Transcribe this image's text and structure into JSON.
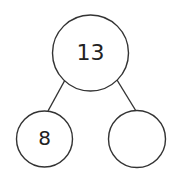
{
  "diagram": {
    "type": "number-bond",
    "whole": {
      "value": "13"
    },
    "parts": [
      {
        "value": "8"
      },
      {
        "value": ""
      }
    ],
    "stroke_color": "#333333",
    "background_color": "#ffffff"
  }
}
